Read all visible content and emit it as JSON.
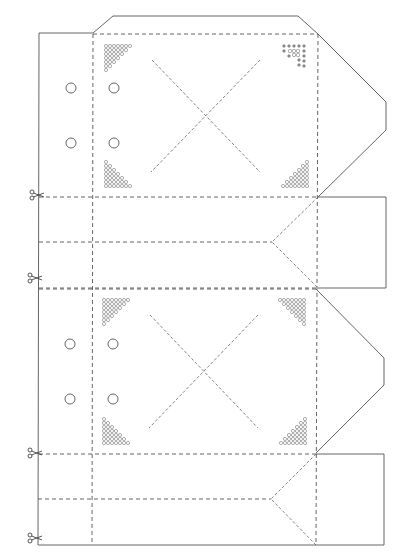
{
  "diagram": {
    "type": "papercraft-box-template",
    "colors": {
      "background": "#ffffff",
      "line": "#555555",
      "motif": "#6a6a6a"
    },
    "line_legend": {
      "solid": "cut-line",
      "dashed": "fold-line"
    },
    "panels": [
      {
        "id": "panel-1",
        "top": 33,
        "bottom": 197,
        "holes": [
          [
            71,
            88
          ],
          [
            114,
            88
          ],
          [
            71,
            143
          ],
          [
            114,
            143
          ]
        ],
        "motifs": [
          "top-left",
          "top-right",
          "bottom-left",
          "bottom-right"
        ],
        "top_right_motif_style": "cross"
      },
      {
        "id": "panel-2",
        "top": 289,
        "bottom": 454,
        "holes": [
          [
            70,
            344
          ],
          [
            113,
            344
          ],
          [
            70,
            399
          ],
          [
            113,
            399
          ]
        ],
        "motifs": [
          "top-left",
          "top-right",
          "bottom-left",
          "bottom-right"
        ],
        "top_right_motif_style": "circle"
      }
    ],
    "strips": [
      {
        "id": "strip-1",
        "top": 197,
        "bottom": 288,
        "middle": 242,
        "v_point_x": 272
      },
      {
        "id": "strip-2",
        "top": 454,
        "bottom": 545,
        "middle": 499,
        "v_point_x": 271
      }
    ],
    "scissors_marks": [
      {
        "x": 32,
        "y": 195
      },
      {
        "x": 30,
        "y": 278
      },
      {
        "x": 30,
        "y": 453
      },
      {
        "x": 30,
        "y": 538
      }
    ],
    "icons": {
      "scissors": "scissors-icon",
      "hole": "punch-hole-icon",
      "motif": "cross-stitch-motif"
    }
  }
}
